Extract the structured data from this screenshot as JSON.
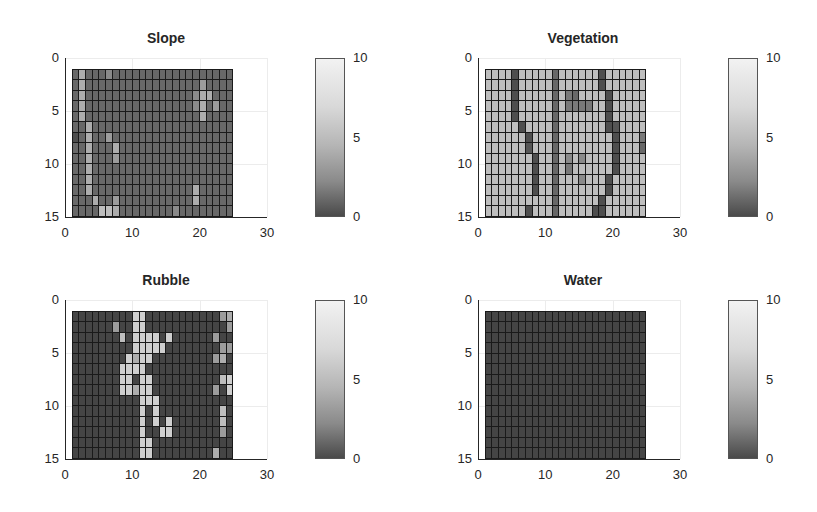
{
  "chart_data": [
    {
      "type": "heatmap",
      "title": "Slope",
      "xlabel": "",
      "ylabel": "",
      "xlim": [
        0,
        30
      ],
      "ylim": [
        0,
        15
      ],
      "y_reversed": true,
      "xticks": [
        "0",
        "10",
        "20",
        "30"
      ],
      "yticks": [
        "0",
        "5",
        "10",
        "15"
      ],
      "colorbar": {
        "min": 0,
        "max": 10,
        "ticks": [
          "0",
          "5",
          "10"
        ]
      },
      "grid_extent": {
        "x": [
          1,
          25
        ],
        "y": [
          1,
          15
        ],
        "cols": 24,
        "rows": 14
      },
      "base_value": 2,
      "cells": [
        {
          "r": 1,
          "c": 2,
          "v": 6
        },
        {
          "r": 2,
          "c": 2,
          "v": 6
        },
        {
          "r": 3,
          "c": 2,
          "v": 6
        },
        {
          "r": 4,
          "c": 2,
          "v": 6
        },
        {
          "r": 5,
          "c": 2,
          "v": 6
        },
        {
          "r": 1,
          "c": 6,
          "v": 4
        },
        {
          "r": 6,
          "c": 3,
          "v": 6
        },
        {
          "r": 7,
          "c": 3,
          "v": 6
        },
        {
          "r": 8,
          "c": 3,
          "v": 6
        },
        {
          "r": 9,
          "c": 3,
          "v": 6
        },
        {
          "r": 10,
          "c": 3,
          "v": 6
        },
        {
          "r": 11,
          "c": 3,
          "v": 6
        },
        {
          "r": 12,
          "c": 3,
          "v": 6
        },
        {
          "r": 7,
          "c": 1,
          "v": 0.5
        },
        {
          "r": 7,
          "c": 6,
          "v": 5
        },
        {
          "r": 8,
          "c": 7,
          "v": 6
        },
        {
          "r": 9,
          "c": 7,
          "v": 5
        },
        {
          "r": 13,
          "c": 4,
          "v": 6
        },
        {
          "r": 13,
          "c": 7,
          "v": 5
        },
        {
          "r": 14,
          "c": 5,
          "v": 7
        },
        {
          "r": 14,
          "c": 6,
          "v": 7
        },
        {
          "r": 14,
          "c": 7,
          "v": 6
        },
        {
          "r": 14,
          "c": 16,
          "v": 4
        },
        {
          "r": 2,
          "c": 20,
          "v": 5
        },
        {
          "r": 3,
          "c": 20,
          "v": 6
        },
        {
          "r": 4,
          "c": 20,
          "v": 6
        },
        {
          "r": 5,
          "c": 20,
          "v": 6
        },
        {
          "r": 3,
          "c": 19,
          "v": 4
        },
        {
          "r": 4,
          "c": 19,
          "v": 4
        },
        {
          "r": 3,
          "c": 21,
          "v": 6
        },
        {
          "r": 4,
          "c": 22,
          "v": 5
        },
        {
          "r": 12,
          "c": 19,
          "v": 6
        },
        {
          "r": 13,
          "c": 19,
          "v": 6
        }
      ]
    },
    {
      "type": "heatmap",
      "title": "Vegetation",
      "xlabel": "",
      "ylabel": "",
      "xlim": [
        0,
        30
      ],
      "ylim": [
        0,
        15
      ],
      "y_reversed": true,
      "xticks": [
        "0",
        "10",
        "20",
        "30"
      ],
      "yticks": [
        "0",
        "5",
        "10",
        "15"
      ],
      "colorbar": {
        "min": 0,
        "max": 10,
        "ticks": [
          "0",
          "5",
          "10"
        ]
      },
      "grid_extent": {
        "x": [
          1,
          25
        ],
        "y": [
          1,
          15
        ],
        "cols": 24,
        "rows": 14
      },
      "base_value": 7,
      "cells": [
        {
          "r": 1,
          "c": 5,
          "v": 0.5
        },
        {
          "r": 2,
          "c": 5,
          "v": 0.5
        },
        {
          "r": 3,
          "c": 5,
          "v": 0.5
        },
        {
          "r": 4,
          "c": 5,
          "v": 0.5
        },
        {
          "r": 5,
          "c": 5,
          "v": 0.5
        },
        {
          "r": 6,
          "c": 6,
          "v": 0.5
        },
        {
          "r": 7,
          "c": 7,
          "v": 0.5
        },
        {
          "r": 8,
          "c": 7,
          "v": 1
        },
        {
          "r": 9,
          "c": 8,
          "v": 0.5
        },
        {
          "r": 10,
          "c": 8,
          "v": 0.5
        },
        {
          "r": 11,
          "c": 8,
          "v": 0.5
        },
        {
          "r": 12,
          "c": 8,
          "v": 0.5
        },
        {
          "r": 14,
          "c": 7,
          "v": 0.5
        },
        {
          "r": 1,
          "c": 11,
          "v": 2
        },
        {
          "r": 2,
          "c": 11,
          "v": 2
        },
        {
          "r": 3,
          "c": 11,
          "v": 2
        },
        {
          "r": 4,
          "c": 11,
          "v": 2
        },
        {
          "r": 5,
          "c": 11,
          "v": 2
        },
        {
          "r": 6,
          "c": 11,
          "v": 2
        },
        {
          "r": 7,
          "c": 11,
          "v": 2
        },
        {
          "r": 8,
          "c": 11,
          "v": 2
        },
        {
          "r": 9,
          "c": 11,
          "v": 2
        },
        {
          "r": 10,
          "c": 11,
          "v": 2
        },
        {
          "r": 11,
          "c": 11,
          "v": 2
        },
        {
          "r": 12,
          "c": 11,
          "v": 2
        },
        {
          "r": 13,
          "c": 11,
          "v": 2
        },
        {
          "r": 14,
          "c": 11,
          "v": 2
        },
        {
          "r": 3,
          "c": 13,
          "v": 3
        },
        {
          "r": 3,
          "c": 14,
          "v": 2
        },
        {
          "r": 4,
          "c": 13,
          "v": 3
        },
        {
          "r": 4,
          "c": 14,
          "v": 3
        },
        {
          "r": 4,
          "c": 15,
          "v": 3
        },
        {
          "r": 4,
          "c": 16,
          "v": 3
        },
        {
          "r": 9,
          "c": 13,
          "v": 4
        },
        {
          "r": 9,
          "c": 15,
          "v": 4
        },
        {
          "r": 10,
          "c": 13,
          "v": 3
        },
        {
          "r": 11,
          "c": 15,
          "v": 4
        },
        {
          "r": 1,
          "c": 18,
          "v": 0.5
        },
        {
          "r": 2,
          "c": 18,
          "v": 0.5
        },
        {
          "r": 3,
          "c": 19,
          "v": 0.5
        },
        {
          "r": 4,
          "c": 19,
          "v": 0.5
        },
        {
          "r": 5,
          "c": 19,
          "v": 0.5
        },
        {
          "r": 6,
          "c": 19,
          "v": 0.5
        },
        {
          "r": 6,
          "c": 20,
          "v": 1
        },
        {
          "r": 7,
          "c": 20,
          "v": 0.5
        },
        {
          "r": 8,
          "c": 20,
          "v": 0.5
        },
        {
          "r": 9,
          "c": 20,
          "v": 0.5
        },
        {
          "r": 10,
          "c": 20,
          "v": 0.5
        },
        {
          "r": 11,
          "c": 19,
          "v": 0.5
        },
        {
          "r": 12,
          "c": 19,
          "v": 0.5
        },
        {
          "r": 13,
          "c": 18,
          "v": 0.5
        },
        {
          "r": 14,
          "c": 17,
          "v": 0.5
        },
        {
          "r": 14,
          "c": 18,
          "v": 0.5
        },
        {
          "r": 7,
          "c": 24,
          "v": 3
        },
        {
          "r": 8,
          "c": 24,
          "v": 2
        }
      ]
    },
    {
      "type": "heatmap",
      "title": "Rubble",
      "xlabel": "",
      "ylabel": "",
      "xlim": [
        0,
        30
      ],
      "ylim": [
        0,
        15
      ],
      "y_reversed": true,
      "xticks": [
        "0",
        "10",
        "20",
        "30"
      ],
      "yticks": [
        "0",
        "5",
        "10",
        "15"
      ],
      "colorbar": {
        "min": 0,
        "max": 10,
        "ticks": [
          "0",
          "5",
          "10"
        ]
      },
      "grid_extent": {
        "x": [
          1,
          25
        ],
        "y": [
          1,
          15
        ],
        "cols": 24,
        "rows": 14
      },
      "base_value": 0,
      "cells": [
        {
          "r": 1,
          "c": 10,
          "v": 8
        },
        {
          "r": 1,
          "c": 11,
          "v": 8
        },
        {
          "r": 1,
          "c": 23,
          "v": 5
        },
        {
          "r": 1,
          "c": 24,
          "v": 6
        },
        {
          "r": 2,
          "c": 7,
          "v": 5
        },
        {
          "r": 2,
          "c": 10,
          "v": 8
        },
        {
          "r": 2,
          "c": 11,
          "v": 8
        },
        {
          "r": 2,
          "c": 24,
          "v": 5
        },
        {
          "r": 3,
          "c": 8,
          "v": 7
        },
        {
          "r": 3,
          "c": 10,
          "v": 8
        },
        {
          "r": 3,
          "c": 11,
          "v": 8
        },
        {
          "r": 3,
          "c": 12,
          "v": 8
        },
        {
          "r": 3,
          "c": 13,
          "v": 8
        },
        {
          "r": 3,
          "c": 15,
          "v": 8
        },
        {
          "r": 3,
          "c": 22,
          "v": 5
        },
        {
          "r": 4,
          "c": 10,
          "v": 8
        },
        {
          "r": 4,
          "c": 11,
          "v": 8
        },
        {
          "r": 4,
          "c": 12,
          "v": 8
        },
        {
          "r": 4,
          "c": 13,
          "v": 8
        },
        {
          "r": 4,
          "c": 14,
          "v": 8
        },
        {
          "r": 4,
          "c": 23,
          "v": 5
        },
        {
          "r": 4,
          "c": 24,
          "v": 5
        },
        {
          "r": 5,
          "c": 9,
          "v": 8
        },
        {
          "r": 5,
          "c": 10,
          "v": 6
        },
        {
          "r": 5,
          "c": 11,
          "v": 8
        },
        {
          "r": 5,
          "c": 12,
          "v": 8
        },
        {
          "r": 5,
          "c": 22,
          "v": 5
        },
        {
          "r": 5,
          "c": 23,
          "v": 6
        },
        {
          "r": 6,
          "c": 8,
          "v": 8
        },
        {
          "r": 6,
          "c": 9,
          "v": 8
        },
        {
          "r": 6,
          "c": 10,
          "v": 8
        },
        {
          "r": 6,
          "c": 11,
          "v": 8
        },
        {
          "r": 7,
          "c": 8,
          "v": 8
        },
        {
          "r": 7,
          "c": 9,
          "v": 8
        },
        {
          "r": 7,
          "c": 11,
          "v": 8
        },
        {
          "r": 7,
          "c": 12,
          "v": 8
        },
        {
          "r": 7,
          "c": 23,
          "v": 7
        },
        {
          "r": 7,
          "c": 24,
          "v": 8
        },
        {
          "r": 8,
          "c": 8,
          "v": 8
        },
        {
          "r": 8,
          "c": 9,
          "v": 8
        },
        {
          "r": 8,
          "c": 10,
          "v": 6
        },
        {
          "r": 8,
          "c": 11,
          "v": 8
        },
        {
          "r": 8,
          "c": 12,
          "v": 8
        },
        {
          "r": 8,
          "c": 22,
          "v": 5
        },
        {
          "r": 8,
          "c": 24,
          "v": 8
        },
        {
          "r": 9,
          "c": 11,
          "v": 8
        },
        {
          "r": 9,
          "c": 12,
          "v": 8
        },
        {
          "r": 9,
          "c": 13,
          "v": 8
        },
        {
          "r": 10,
          "c": 11,
          "v": 8
        },
        {
          "r": 10,
          "c": 13,
          "v": 8
        },
        {
          "r": 10,
          "c": 23,
          "v": 7
        },
        {
          "r": 11,
          "c": 11,
          "v": 8
        },
        {
          "r": 11,
          "c": 13,
          "v": 8
        },
        {
          "r": 11,
          "c": 15,
          "v": 8
        },
        {
          "r": 11,
          "c": 23,
          "v": 7
        },
        {
          "r": 12,
          "c": 11,
          "v": 8
        },
        {
          "r": 12,
          "c": 14,
          "v": 8
        },
        {
          "r": 12,
          "c": 15,
          "v": 8
        },
        {
          "r": 12,
          "c": 23,
          "v": 5
        },
        {
          "r": 13,
          "c": 11,
          "v": 8
        },
        {
          "r": 13,
          "c": 12,
          "v": 8
        },
        {
          "r": 14,
          "c": 11,
          "v": 8
        },
        {
          "r": 14,
          "c": 12,
          "v": 8
        },
        {
          "r": 14,
          "c": 22,
          "v": 6
        }
      ]
    },
    {
      "type": "heatmap",
      "title": "Water",
      "xlabel": "",
      "ylabel": "",
      "xlim": [
        0,
        30
      ],
      "ylim": [
        0,
        15
      ],
      "y_reversed": true,
      "xticks": [
        "0",
        "10",
        "20",
        "30"
      ],
      "yticks": [
        "0",
        "5",
        "10",
        "15"
      ],
      "colorbar": {
        "min": 0,
        "max": 10,
        "ticks": [
          "0",
          "5",
          "10"
        ]
      },
      "grid_extent": {
        "x": [
          1,
          25
        ],
        "y": [
          1,
          15
        ],
        "cols": 24,
        "rows": 14
      },
      "base_value": 0,
      "cells": []
    }
  ],
  "panels": [
    {
      "title": "Slope"
    },
    {
      "title": "Vegetation"
    },
    {
      "title": "Rubble"
    },
    {
      "title": "Water"
    }
  ],
  "colors": {
    "grid_line": "#1a1a1a",
    "cmap_low": "#454545",
    "cmap_high": "#f2f2f2"
  }
}
